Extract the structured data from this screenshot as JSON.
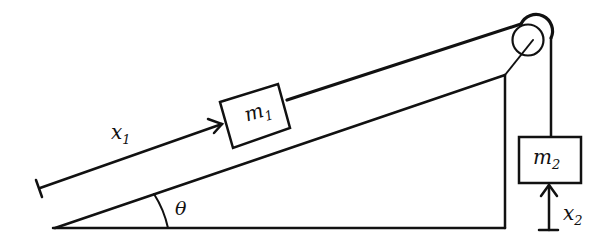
{
  "diagram": {
    "type": "inclined-plane-pulley",
    "labels": {
      "m1": "m",
      "m1_sub": "1",
      "m2": "m",
      "m2_sub": "2",
      "x1": "x",
      "x1_sub": "1",
      "x2": "x",
      "x2_sub": "2",
      "theta": "θ"
    },
    "colors": {
      "stroke": "#111111",
      "background": "#ffffff"
    }
  }
}
